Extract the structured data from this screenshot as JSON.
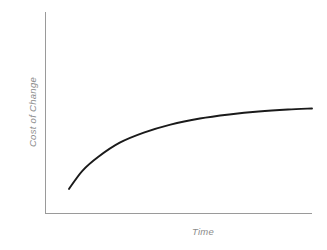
{
  "chart_data": {
    "type": "line",
    "title": "",
    "subtitle": "",
    "xlabel": "Time",
    "ylabel": "Cost of Change",
    "grid": false,
    "legend": null,
    "legend_position": "none",
    "x_tick_labels": [],
    "y_tick_labels": [],
    "xlim": [
      0,
      10
    ],
    "ylim": [
      0,
      10
    ],
    "axis_color": "#9a9a9a",
    "curve_color": "#1a1a1a",
    "label_color": "#8c8c8c",
    "background_color": "#ffffff",
    "annotations": [],
    "series": [
      {
        "name": "Cost of Change",
        "shape": "logarithmic-rising-concave-down",
        "x": [
          0.9,
          1.4,
          2.0,
          2.8,
          3.7,
          4.7,
          5.8,
          6.9,
          8.0,
          9.1,
          10.0
        ],
        "y": [
          1.2,
          2.1,
          2.8,
          3.5,
          4.0,
          4.4,
          4.7,
          4.9,
          5.05,
          5.15,
          5.2
        ]
      }
    ]
  },
  "labels": {
    "y_axis": "Cost of Change",
    "x_axis": "Time"
  }
}
